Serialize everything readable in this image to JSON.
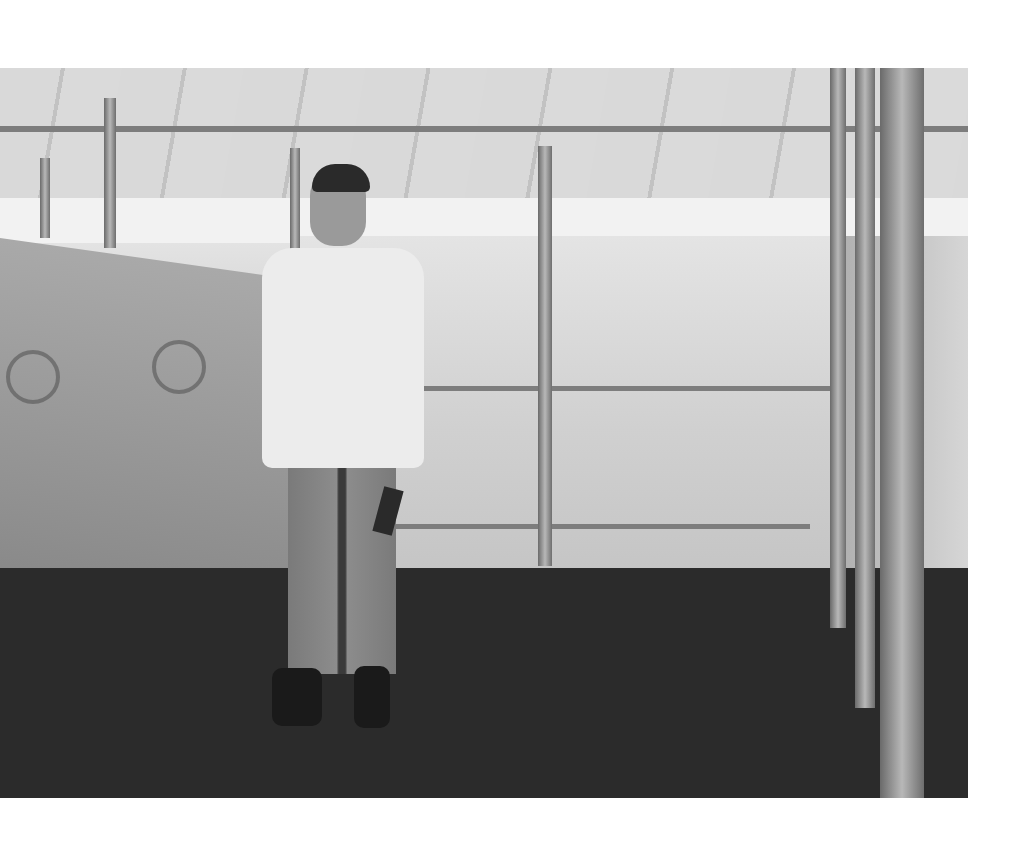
{
  "image": {
    "description": "Black-and-white photograph of a young man in a white long-sleeve t-shirt and jeans holding a small notebook, standing inside an empty bamboo-framed shelter covered with tarpaulin sheets bearing UNHCR logos, on a dark floor.",
    "tarp_text": "UNHCR",
    "tarp_subtext": "The UN Refugee Agency",
    "colors": {
      "page_background": "#ffffff",
      "photo_tone": "grayscale"
    }
  }
}
